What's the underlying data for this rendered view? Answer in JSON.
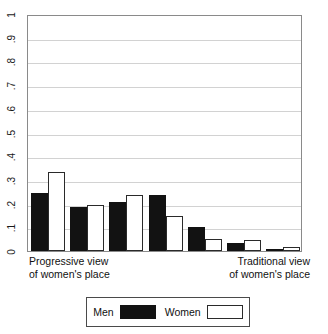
{
  "chart_data": {
    "type": "bar",
    "title": "",
    "subtitle": "",
    "xlabel": "",
    "ylabel": "",
    "grid": true,
    "ylim": [
      0,
      1
    ],
    "categories": [
      "1",
      "2",
      "3",
      "4",
      "5",
      "6",
      "7"
    ],
    "x_axis_annotations": {
      "left_line1": "Progressive view",
      "left_line2": "of women's place",
      "right_line1": "Traditional view",
      "right_line2": "of women's place"
    },
    "y_tick_labels": [
      "0",
      ".1",
      ".2",
      ".3",
      ".4",
      ".5",
      ".6",
      ".7",
      ".8",
      ".9",
      "1"
    ],
    "y_tick_values": [
      0,
      0.1,
      0.2,
      0.3,
      0.4,
      0.5,
      0.6,
      0.7,
      0.8,
      0.9,
      1
    ],
    "series": [
      {
        "name": "Men",
        "color": "#121212",
        "fill": "solid-black",
        "values": [
          0.245,
          0.185,
          0.205,
          0.235,
          0.1,
          0.035,
          0.008
        ]
      },
      {
        "name": "Women",
        "color": "#ffffff",
        "fill": "white-outlined",
        "values": [
          0.335,
          0.195,
          0.235,
          0.148,
          0.05,
          0.047,
          0.015
        ]
      }
    ],
    "legend": {
      "position": "bottom",
      "entries": [
        {
          "label": "Men",
          "swatch": "men"
        },
        {
          "label": "Women",
          "swatch": "women"
        }
      ]
    }
  }
}
